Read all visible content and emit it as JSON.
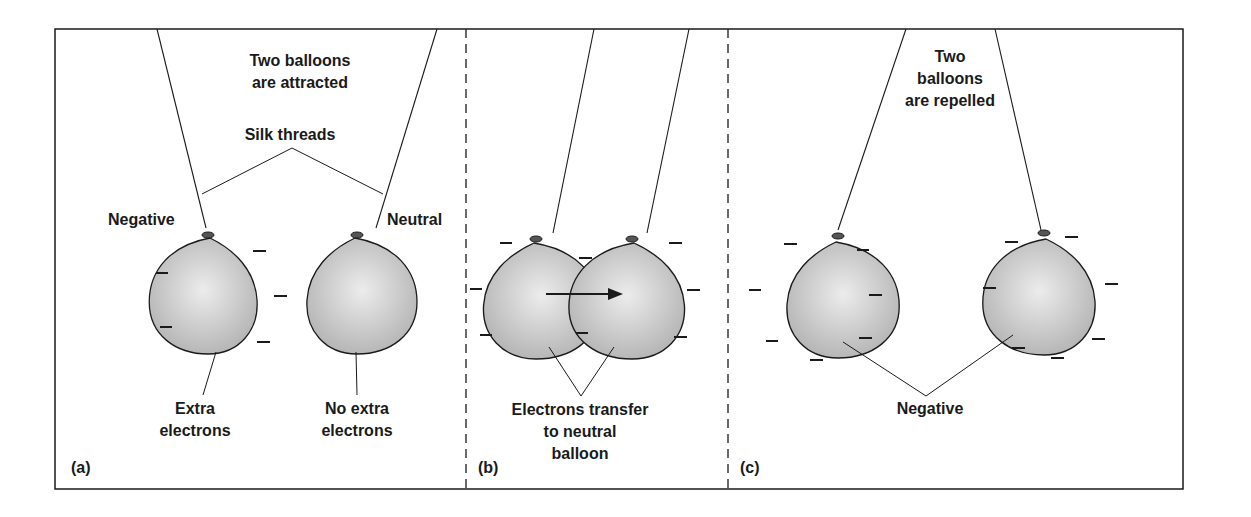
{
  "figure": {
    "panels": [
      {
        "id": "a",
        "label": "(a)",
        "title_line1": "Two balloons",
        "title_line2": "are attracted",
        "threads_label": "Silk threads",
        "left_charge_label": "Negative",
        "right_charge_label": "Neutral",
        "left_caption_line1": "Extra",
        "left_caption_line2": "electrons",
        "right_caption_line1": "No extra",
        "right_caption_line2": "electrons"
      },
      {
        "id": "b",
        "label": "(b)",
        "caption_line1": "Electrons transfer",
        "caption_line2": "to neutral",
        "caption_line3": "balloon"
      },
      {
        "id": "c",
        "label": "(c)",
        "title_line1": "Two",
        "title_line2": "balloons",
        "title_line3": "are repelled",
        "charge_label": "Negative"
      }
    ],
    "colors": {
      "line": "#1a1a1a",
      "balloon_light": "#e6e6e6",
      "balloon_dark": "#b4b4b4"
    }
  }
}
